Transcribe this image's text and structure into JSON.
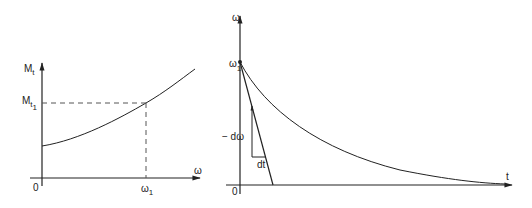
{
  "left_chart": {
    "y_axis_label": "M",
    "y_axis_label_sub": "t",
    "y_marker_label": "M",
    "y_marker_label_sub": "t",
    "y_marker_label_sub2": "1",
    "x_axis_label": "ω",
    "x_marker_label": "ω",
    "x_marker_label_sub": "1",
    "origin_label": "0"
  },
  "right_chart": {
    "y_axis_label": "ω",
    "y_marker_label": "ω",
    "y_marker_label_sub": "1",
    "x_axis_label": "t",
    "origin_label": "0",
    "delta_omega_label": "− dω",
    "delta_t_label": "dt"
  },
  "colors": {
    "stroke": "#222222",
    "dashed": "#555555",
    "background": "#ffffff"
  }
}
